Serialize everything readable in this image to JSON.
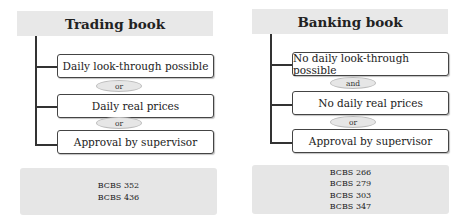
{
  "trading_book": {
    "title": "Trading book",
    "conditions": [
      "Daily look-through possible",
      "Daily real prices",
      "Approval by supervisor"
    ],
    "connectors": [
      "or",
      "or"
    ],
    "references": [
      "BCBS 352",
      "BCBS 436"
    ]
  },
  "banking_book": {
    "title": "Banking book",
    "conditions": [
      "No daily look-through possible",
      "No daily real prices",
      "Approval by supervisor"
    ],
    "connectors": [
      "and",
      "or"
    ],
    "references": [
      "BCBS 266",
      "BCBS 279",
      "BCBS 303",
      "BCBS 347"
    ]
  },
  "colors": {
    "header_bg": "#e8e8e8",
    "connector_bg": "#e6e6e6",
    "line": "#333333"
  }
}
